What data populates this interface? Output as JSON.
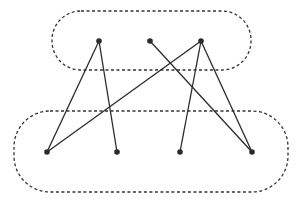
{
  "diagram": {
    "type": "bipartite-graph",
    "colors": {
      "stroke": "#2b2b2b",
      "dashed_border": "#333333",
      "background": "#ffffff"
    },
    "groups": [
      {
        "id": "top",
        "x": 52,
        "y": 11,
        "width": 199,
        "height": 59,
        "rx": 29
      },
      {
        "id": "bottom",
        "x": 14,
        "y": 111,
        "width": 274,
        "height": 81,
        "rx": 36
      }
    ],
    "nodes": [
      {
        "id": "t1",
        "group": "top",
        "x": 99,
        "y": 41
      },
      {
        "id": "t2",
        "group": "top",
        "x": 150,
        "y": 41
      },
      {
        "id": "t3",
        "group": "top",
        "x": 201,
        "y": 41
      },
      {
        "id": "b1",
        "group": "bottom",
        "x": 47,
        "y": 152
      },
      {
        "id": "b2",
        "group": "bottom",
        "x": 117,
        "y": 152
      },
      {
        "id": "b3",
        "group": "bottom",
        "x": 180,
        "y": 152
      },
      {
        "id": "b4",
        "group": "bottom",
        "x": 252,
        "y": 152
      }
    ],
    "edges": [
      [
        "t1",
        "b1"
      ],
      [
        "t1",
        "b2"
      ],
      [
        "t2",
        "b4"
      ],
      [
        "t3",
        "b1"
      ],
      [
        "t3",
        "b3"
      ],
      [
        "t3",
        "b4"
      ]
    ]
  }
}
